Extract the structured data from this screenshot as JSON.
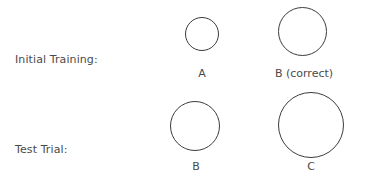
{
  "rows": [
    {
      "label": "Initial Training:",
      "stimuli": [
        {
          "label": "A",
          "size": "small"
        },
        {
          "label": "B (correct)",
          "size": "medium"
        }
      ]
    },
    {
      "label": "Test Trial:",
      "stimuli": [
        {
          "label": "B",
          "size": "medium"
        },
        {
          "label": "C",
          "size": "large"
        }
      ]
    }
  ]
}
